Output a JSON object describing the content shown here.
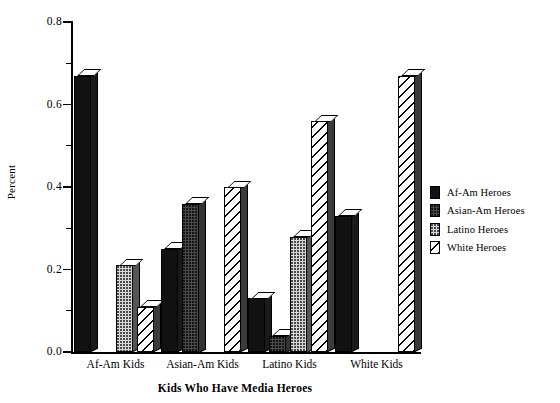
{
  "chart_data": {
    "type": "bar",
    "title": "",
    "xlabel": "Kids Who Have Media Heroes",
    "ylabel": "Percent",
    "categories": [
      "Af-Am Kids",
      "Asian-Am Kids",
      "Latino Kids",
      "White Kids"
    ],
    "series": [
      {
        "name": "Af-Am Heroes",
        "fill": "solid",
        "values": [
          0.67,
          0.25,
          0.13,
          0.33
        ]
      },
      {
        "name": "Asian-Am Heroes",
        "fill": "dense",
        "values": [
          0.0,
          0.36,
          0.04,
          0.0
        ]
      },
      {
        "name": "Latino Heroes",
        "fill": "dots",
        "values": [
          0.21,
          0.0,
          0.28,
          0.0
        ]
      },
      {
        "name": "White Heroes",
        "fill": "hatch",
        "values": [
          0.11,
          0.4,
          0.56,
          0.67
        ]
      }
    ],
    "ylim": [
      0.0,
      0.8
    ],
    "yticks": [
      "0.0",
      "0.2",
      "0.4",
      "0.6",
      "0.8"
    ],
    "ytick_values": [
      0.0,
      0.2,
      0.4,
      0.6,
      0.8
    ],
    "yminor_values": [
      0.1,
      0.3,
      0.5,
      0.7
    ],
    "grid": false,
    "legend_position": "right",
    "style": "3d-bar",
    "colors": {
      "af_am_heroes": "#111111",
      "asian_am_heroes": "#4a4a4a",
      "latino_heroes": "#d8d8d8",
      "white_heroes": "#ffffff",
      "axis": "#000000",
      "background": "#ffffff"
    }
  },
  "legend": {
    "items": [
      {
        "label": "Af-Am Heroes"
      },
      {
        "label": "Asian-Am Heroes"
      },
      {
        "label": "Latino Heroes"
      },
      {
        "label": "White Heroes"
      }
    ]
  }
}
